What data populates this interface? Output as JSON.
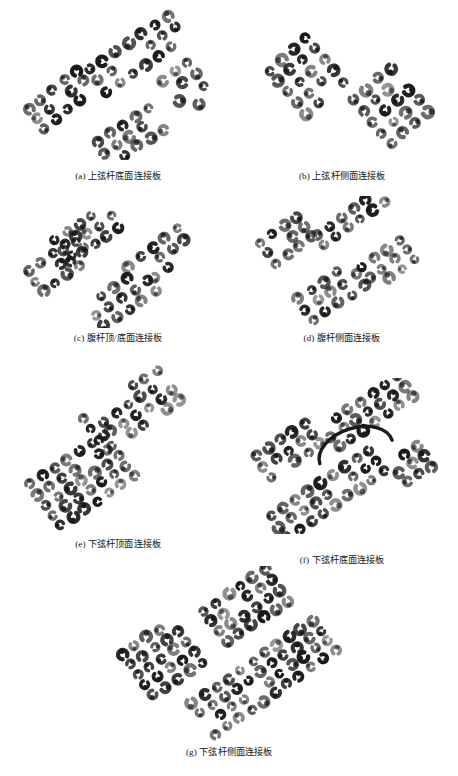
{
  "figure": {
    "background_color": "#ffffff",
    "ink_color": "#1a1a1a",
    "total_panels": 7,
    "layout": "2-column grid with final panel centered"
  },
  "panels": [
    {
      "key": "a",
      "label": "(a)",
      "caption": "(a) 上弦杆底面连接板",
      "caption_text_only": "上弦杆底面连接板",
      "translation_hint": "Top chord bottom-face connection plate",
      "x": 12,
      "y": 8,
      "w": 212,
      "h": 152,
      "caption_top": 162,
      "groups": [
        {
          "name": "upper-band",
          "cx": 125,
          "cy": 46,
          "rows": 3,
          "cols": 7,
          "dx": 15.0,
          "dy": -5.0,
          "ex": 5.0,
          "ey": 13.0,
          "rot": -16,
          "r": 4.2,
          "density": 0.78
        },
        {
          "name": "left-band",
          "cx": 48,
          "cy": 92,
          "rows": 3,
          "cols": 5,
          "dx": 14.0,
          "dy": -5.5,
          "ex": 4.0,
          "ey": 12.0,
          "rot": -18,
          "r": 4.3,
          "density": 0.82
        },
        {
          "name": "right-band",
          "cx": 175,
          "cy": 80,
          "rows": 4,
          "cols": 3,
          "dx": 14.0,
          "dy": -5.0,
          "ex": 4.5,
          "ey": 12.5,
          "rot": -15,
          "r": 4.1,
          "density": 0.8
        },
        {
          "name": "lower-band",
          "cx": 118,
          "cy": 128,
          "rows": 3,
          "cols": 5,
          "dx": 14.5,
          "dy": -5.0,
          "ex": 4.5,
          "ey": 12.0,
          "rot": -14,
          "r": 4.1,
          "density": 0.72
        }
      ]
    },
    {
      "key": "b",
      "label": "(b)",
      "caption": "(b) 上弦杆侧面连接板",
      "caption_text_only": "上弦杆侧面连接板",
      "translation_hint": "Top chord side-face connection plate",
      "x": 236,
      "y": 8,
      "w": 212,
      "h": 152,
      "caption_top": 162,
      "groups": [
        {
          "name": "left-array",
          "cx": 70,
          "cy": 68,
          "rows": 5,
          "cols": 4,
          "dx": 15.0,
          "dy": -6.0,
          "ex": 5.0,
          "ey": 13.5,
          "rot": -20,
          "r": 4.3,
          "density": 0.88
        },
        {
          "name": "right-array",
          "cx": 155,
          "cy": 98,
          "rows": 5,
          "cols": 4,
          "dx": 15.0,
          "dy": -6.0,
          "ex": 5.0,
          "ey": 13.5,
          "rot": -20,
          "r": 4.3,
          "density": 0.88
        }
      ]
    },
    {
      "key": "c",
      "label": "(c)",
      "caption": "(c) 腹杆顶/底面连接板",
      "caption_text_only": "腹杆顶/底面连接板",
      "translation_hint": "Web member top/bottom-face connection plate",
      "x": 12,
      "y": 196,
      "w": 212,
      "h": 132,
      "caption_top": 136,
      "groups": [
        {
          "name": "upper-left-cluster",
          "cx": 75,
          "cy": 38,
          "rows": 3,
          "cols": 5,
          "dx": 14.0,
          "dy": -5.0,
          "ex": 4.5,
          "ey": 12.0,
          "rot": -16,
          "r": 4.0,
          "density": 0.9
        },
        {
          "name": "left-band",
          "cx": 48,
          "cy": 68,
          "rows": 3,
          "cols": 5,
          "dx": 14.0,
          "dy": -5.0,
          "ex": 4.5,
          "ey": 12.0,
          "rot": -16,
          "r": 4.0,
          "density": 0.85
        },
        {
          "name": "right-band",
          "cx": 148,
          "cy": 62,
          "rows": 3,
          "cols": 5,
          "dx": 14.5,
          "dy": -5.5,
          "ex": 4.5,
          "ey": 12.0,
          "rot": -16,
          "r": 4.0,
          "density": 0.85
        },
        {
          "name": "lower-band",
          "cx": 110,
          "cy": 102,
          "rows": 3,
          "cols": 5,
          "dx": 14.5,
          "dy": -5.0,
          "ex": 4.5,
          "ey": 12.0,
          "rot": -14,
          "r": 4.0,
          "density": 0.82
        }
      ]
    },
    {
      "key": "d",
      "label": "(d)",
      "caption": "(d) 腹杆侧面连接板",
      "caption_text_only": "腹杆侧面连接板",
      "translation_hint": "Web member side-face connection plate",
      "x": 236,
      "y": 196,
      "w": 212,
      "h": 132,
      "caption_top": 136,
      "groups": [
        {
          "name": "upper-right-cluster",
          "cx": 115,
          "cy": 22,
          "rows": 2,
          "cols": 6,
          "dx": 14.0,
          "dy": -5.0,
          "ex": 4.5,
          "ey": 12.0,
          "rot": -16,
          "r": 4.0,
          "density": 0.88
        },
        {
          "name": "upper-left-cluster",
          "cx": 50,
          "cy": 44,
          "rows": 3,
          "cols": 4,
          "dx": 14.0,
          "dy": -5.0,
          "ex": 4.5,
          "ey": 12.0,
          "rot": -16,
          "r": 4.0,
          "density": 0.88
        },
        {
          "name": "right-band",
          "cx": 152,
          "cy": 68,
          "rows": 3,
          "cols": 4,
          "dx": 14.5,
          "dy": -5.5,
          "ex": 4.5,
          "ey": 12.0,
          "rot": -16,
          "r": 4.0,
          "density": 0.86
        },
        {
          "name": "lower-band",
          "cx": 95,
          "cy": 96,
          "rows": 3,
          "cols": 5,
          "dx": 14.5,
          "dy": -5.0,
          "ex": 4.5,
          "ey": 12.5,
          "rot": -15,
          "r": 4.1,
          "density": 0.85
        }
      ]
    },
    {
      "key": "e",
      "label": "(e)",
      "caption": "(e) 下弦杆顶面连接板",
      "caption_text_only": "下弦杆顶面连接板",
      "translation_hint": "Bottom chord top-face connection plate",
      "x": 12,
      "y": 362,
      "w": 212,
      "h": 172,
      "caption_top": 176,
      "groups": [
        {
          "name": "upper-array",
          "cx": 120,
          "cy": 48,
          "rows": 4,
          "cols": 7,
          "dx": 14.0,
          "dy": -4.5,
          "ex": 4.5,
          "ey": 12.0,
          "rot": -16,
          "r": 4.0,
          "density": 0.92
        },
        {
          "name": "lower-array",
          "cx": 70,
          "cy": 118,
          "rows": 5,
          "cols": 7,
          "dx": 14.0,
          "dy": -4.5,
          "ex": 4.5,
          "ey": 12.0,
          "rot": -16,
          "r": 4.2,
          "density": 0.94
        }
      ]
    },
    {
      "key": "f",
      "label": "(f)",
      "caption": "(f) 下弦杆底面连接板",
      "caption_text_only": "下弦杆底面连接板",
      "translation_hint": "Bottom chord bottom-face connection plate",
      "x": 236,
      "y": 378,
      "w": 212,
      "h": 156,
      "caption_top": 176,
      "has_arc_marking": true,
      "arc": {
        "cx": 120,
        "cy": 74,
        "rx": 38,
        "ry": 24,
        "rot": -18,
        "stroke_width": 3.4
      },
      "groups": [
        {
          "name": "upper-array",
          "cx": 132,
          "cy": 34,
          "rows": 3,
          "cols": 7,
          "dx": 14.0,
          "dy": -4.5,
          "ex": 4.5,
          "ey": 12.0,
          "rot": -16,
          "r": 4.2,
          "density": 0.92
        },
        {
          "name": "mid-left-array",
          "cx": 52,
          "cy": 72,
          "rows": 3,
          "cols": 5,
          "dx": 14.0,
          "dy": -4.5,
          "ex": 4.5,
          "ey": 12.0,
          "rot": -16,
          "r": 4.2,
          "density": 0.9
        },
        {
          "name": "lower-array",
          "cx": 92,
          "cy": 116,
          "rows": 3,
          "cols": 9,
          "dx": 14.0,
          "dy": -4.5,
          "ex": 4.5,
          "ey": 12.0,
          "rot": -16,
          "r": 4.2,
          "density": 0.9
        },
        {
          "name": "right-array",
          "cx": 176,
          "cy": 86,
          "rows": 3,
          "cols": 3,
          "dx": 14.0,
          "dy": -4.5,
          "ex": 4.5,
          "ey": 12.0,
          "rot": -16,
          "r": 4.2,
          "density": 0.88
        }
      ]
    },
    {
      "key": "g",
      "label": "(g)",
      "caption": "(g) 下弦杆侧面连接板",
      "caption_text_only": "下弦杆侧面连接板",
      "translation_hint": "Bottom chord side-face connection plate",
      "x": 104,
      "y": 566,
      "w": 250,
      "h": 180,
      "caption_top": 180,
      "groups": [
        {
          "name": "top-array",
          "cx": 142,
          "cy": 40,
          "rows": 4,
          "cols": 6,
          "dx": 14.0,
          "dy": -4.5,
          "ex": 4.5,
          "ey": 12.0,
          "rot": -16,
          "r": 4.1,
          "density": 0.92
        },
        {
          "name": "left-array",
          "cx": 58,
          "cy": 92,
          "rows": 5,
          "cols": 5,
          "dx": 14.0,
          "dy": -4.5,
          "ex": 4.5,
          "ey": 12.0,
          "rot": -16,
          "r": 4.2,
          "density": 0.94
        },
        {
          "name": "right-array",
          "cx": 196,
          "cy": 86,
          "rows": 4,
          "cols": 5,
          "dx": 14.0,
          "dy": -4.5,
          "ex": 4.5,
          "ey": 12.0,
          "rot": -16,
          "r": 4.1,
          "density": 0.92
        },
        {
          "name": "bottom-array",
          "cx": 130,
          "cy": 132,
          "rows": 4,
          "cols": 6,
          "dx": 14.0,
          "dy": -4.5,
          "ex": 4.5,
          "ey": 12.0,
          "rot": -16,
          "r": 4.1,
          "density": 0.9
        }
      ]
    }
  ]
}
